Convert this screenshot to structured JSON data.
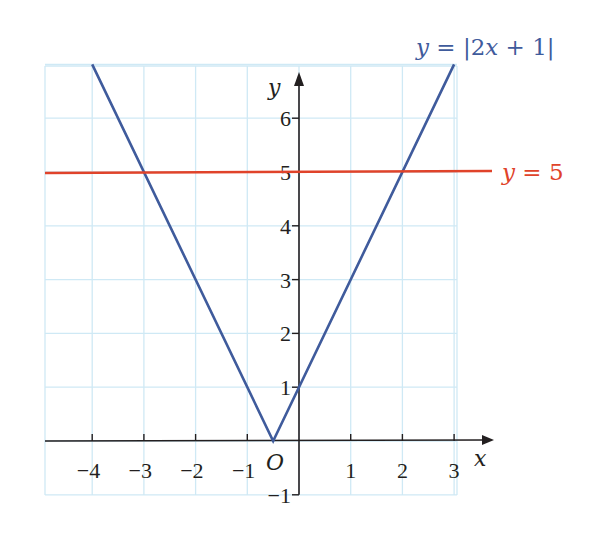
{
  "chart_data": {
    "type": "line",
    "title": "",
    "xlabel": "x",
    "ylabel": "y",
    "origin_label": "O",
    "xlim": [
      -5,
      3.5
    ],
    "ylim": [
      -1,
      7
    ],
    "grid": true,
    "x_ticks": [
      -4,
      -3,
      -2,
      -1,
      1,
      2,
      3
    ],
    "x_tick_labels": [
      "−4",
      "−3",
      "−2",
      "−1",
      "1",
      "2",
      "3"
    ],
    "y_ticks": [
      -1,
      1,
      2,
      3,
      4,
      5,
      6
    ],
    "y_tick_labels": [
      "−1",
      "1",
      "2",
      "3",
      "4",
      "5",
      "6"
    ],
    "series": [
      {
        "name": "y = |2x + 1|",
        "label": "y = |2x + 1|",
        "color": "#3f5b9c",
        "x": [
          -4,
          -0.5,
          3
        ],
        "y": [
          7,
          0,
          7
        ]
      },
      {
        "name": "y = 5",
        "label": "y = 5",
        "color": "#e0432a",
        "x": [
          -5,
          3.5
        ],
        "y": [
          5,
          5
        ]
      }
    ],
    "intersections": [
      {
        "x": -3,
        "y": 5
      },
      {
        "x": 2,
        "y": 5
      }
    ]
  },
  "labels": {
    "abs_curve": "y = |2x + 1|",
    "abs_curve_y": "y",
    "abs_curve_rest": " = |2",
    "abs_curve_x": "x",
    "abs_curve_tail": " + 1|",
    "line5_y": "y",
    "line5_rest": " = 5",
    "x_axis": "x",
    "y_axis": "y",
    "origin": "O"
  },
  "colors": {
    "grid": "#cfe9f5",
    "axis": "#231f20",
    "abs_curve": "#3f5b9c",
    "line5": "#e0432a"
  }
}
